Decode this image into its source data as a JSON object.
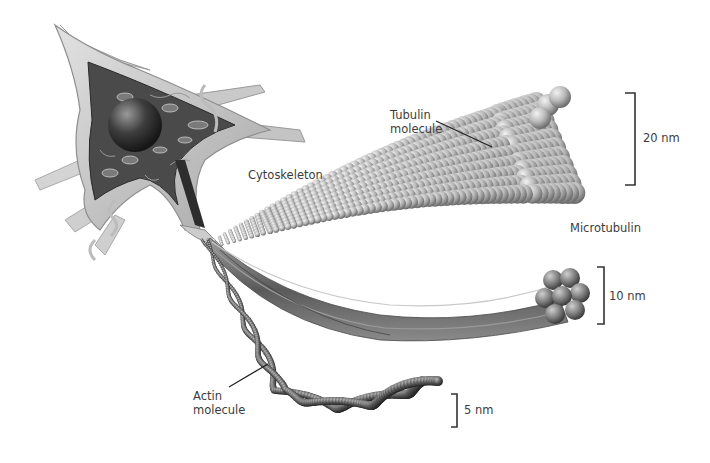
{
  "figure": {
    "colors": {
      "background": "#ffffff",
      "label_text": "#3c3c3c",
      "leader_line": "#222222",
      "scale_bar": "#333333",
      "cell_body_light": "#cfcfcf",
      "cell_body_dark": "#4a4a4a",
      "nucleus": "#3a3a3a",
      "microtubule_sphere": "#bdbdbd",
      "neurofilament": "#6e6e6e",
      "actin": "#3a3a3a"
    }
  },
  "labels": {
    "cytoskeleton": "Cytoskeleton",
    "tubulin_line1": "Tubulin",
    "tubulin_line2": "molecule",
    "microtubule": "Microtubulin",
    "actin_line1": "Actin",
    "actin_line2": "molecule"
  },
  "scale_bars": {
    "microtubule": "20 nm",
    "neurofilament": "10 nm",
    "actin": "5 nm"
  },
  "structures": [
    {
      "name": "neuron cell body",
      "icon": "neuron-icon"
    },
    {
      "name": "microtubule",
      "diameter": "20 nm"
    },
    {
      "name": "neurofilament bundle",
      "diameter": "10 nm"
    },
    {
      "name": "actin filament",
      "diameter": "5 nm"
    }
  ]
}
